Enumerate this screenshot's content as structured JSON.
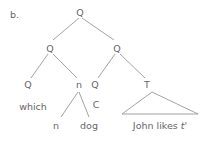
{
  "panel_label": "b.",
  "tree": {
    "root": "Q",
    "left": "Q",
    "right": "Q",
    "left_left": "Q",
    "left_left_word": "which",
    "left_right": "n",
    "left_right_left": "n",
    "left_right_right": "dog",
    "right_left": "Q",
    "right_left_word": "C",
    "right_right": "T",
    "right_right_yield": "John likes ",
    "trace": "t'"
  }
}
